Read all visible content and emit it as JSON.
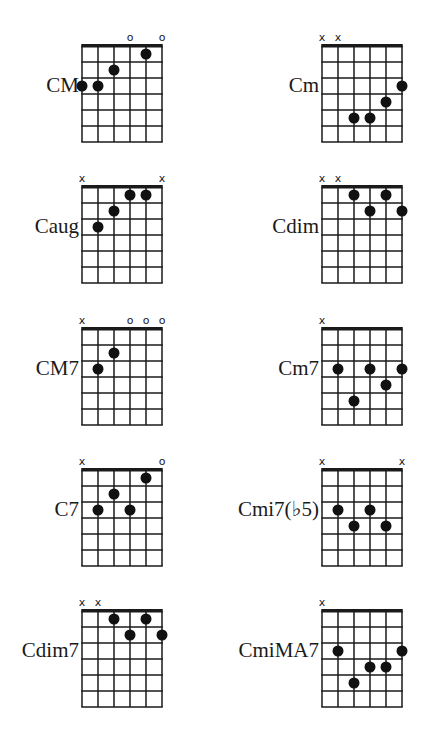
{
  "layout": {
    "columns_x": [
      82,
      322
    ],
    "rows_y": [
      46,
      187,
      329,
      470,
      611
    ],
    "string_gap": 16,
    "fret_gap": 16,
    "frets": 6,
    "dot_color": "#111111",
    "line_color": "#1a1a1a"
  },
  "chords": [
    {
      "name": "CM",
      "col": 0,
      "row": 0,
      "markers": [
        "",
        "",
        "",
        "o",
        "",
        "o"
      ],
      "dots": [
        [
          1,
          3
        ],
        [
          2,
          3
        ],
        [
          3,
          2
        ],
        [
          5,
          1
        ]
      ]
    },
    {
      "name": "Cm",
      "col": 1,
      "row": 0,
      "markers": [
        "x",
        "x",
        "",
        "",
        "",
        ""
      ],
      "dots": [
        [
          3,
          5
        ],
        [
          4,
          5
        ],
        [
          5,
          4
        ],
        [
          6,
          3
        ]
      ]
    },
    {
      "name": "Caug",
      "col": 0,
      "row": 1,
      "markers": [
        "x",
        "",
        "",
        "",
        "",
        "x"
      ],
      "dots": [
        [
          2,
          3
        ],
        [
          3,
          2
        ],
        [
          4,
          1
        ],
        [
          5,
          1
        ]
      ]
    },
    {
      "name": "Cdim",
      "col": 1,
      "row": 1,
      "markers": [
        "x",
        "x",
        "",
        "",
        "",
        ""
      ],
      "dots": [
        [
          3,
          1
        ],
        [
          4,
          2
        ],
        [
          5,
          1
        ],
        [
          6,
          2
        ]
      ]
    },
    {
      "name": "CM7",
      "col": 0,
      "row": 2,
      "markers": [
        "x",
        "",
        "",
        "o",
        "o",
        "o"
      ],
      "dots": [
        [
          2,
          3
        ],
        [
          3,
          2
        ]
      ]
    },
    {
      "name": "Cm7",
      "col": 1,
      "row": 2,
      "markers": [
        "x",
        "",
        "",
        "",
        "",
        ""
      ],
      "dots": [
        [
          2,
          3
        ],
        [
          3,
          5
        ],
        [
          4,
          3
        ],
        [
          5,
          4
        ],
        [
          6,
          3
        ]
      ]
    },
    {
      "name": "C7",
      "col": 0,
      "row": 3,
      "markers": [
        "x",
        "",
        "",
        "",
        "",
        "o"
      ],
      "dots": [
        [
          2,
          3
        ],
        [
          3,
          2
        ],
        [
          4,
          3
        ],
        [
          5,
          1
        ]
      ]
    },
    {
      "name": "Cmi7(♭5)",
      "col": 1,
      "row": 3,
      "markers": [
        "x",
        "",
        "",
        "",
        "",
        "x"
      ],
      "dots": [
        [
          2,
          3
        ],
        [
          3,
          4
        ],
        [
          4,
          3
        ],
        [
          5,
          4
        ]
      ]
    },
    {
      "name": "Cdim7",
      "col": 0,
      "row": 4,
      "markers": [
        "x",
        "x",
        "",
        "",
        "",
        ""
      ],
      "dots": [
        [
          3,
          1
        ],
        [
          4,
          2
        ],
        [
          5,
          1
        ],
        [
          6,
          2
        ]
      ]
    },
    {
      "name": "CmiMA7",
      "col": 1,
      "row": 4,
      "markers": [
        "x",
        "",
        "",
        "",
        "",
        ""
      ],
      "dots": [
        [
          2,
          3
        ],
        [
          3,
          5
        ],
        [
          4,
          4
        ],
        [
          5,
          4
        ],
        [
          6,
          3
        ]
      ]
    }
  ]
}
